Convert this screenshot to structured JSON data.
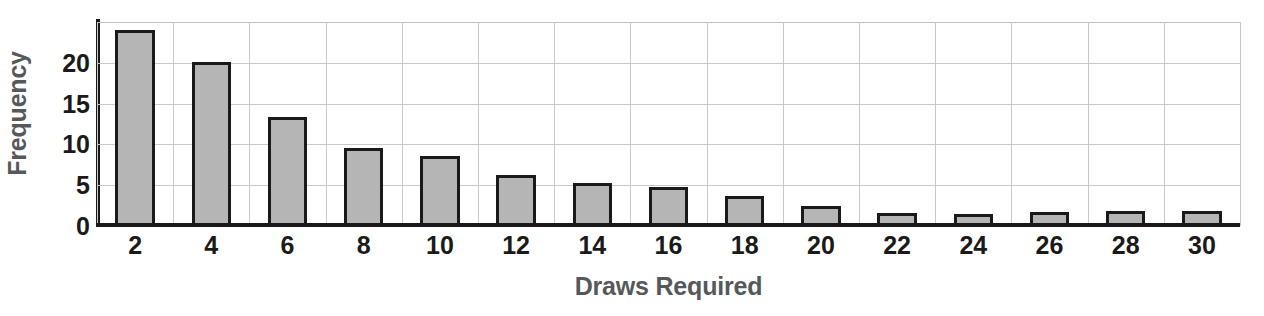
{
  "chart_data": {
    "type": "bar",
    "title": "",
    "subtitle": "",
    "xlabel": "Draws Required",
    "ylabel": "Frequency",
    "categories": [
      "2",
      "4",
      "6",
      "8",
      "10",
      "12",
      "14",
      "16",
      "18",
      "20",
      "22",
      "24",
      "26",
      "28",
      "30"
    ],
    "values": [
      24.0,
      20.1,
      13.4,
      9.6,
      8.6,
      6.2,
      5.3,
      4.8,
      3.7,
      2.4,
      1.6,
      1.5,
      1.7,
      1.8,
      1.8
    ],
    "series": [
      {
        "name": "Frequency",
        "values": [
          24.0,
          20.1,
          13.4,
          9.6,
          8.6,
          6.2,
          5.3,
          4.8,
          3.7,
          2.4,
          1.6,
          1.5,
          1.7,
          1.8,
          1.8
        ]
      }
    ],
    "xlim": [
      1,
      31
    ],
    "ylim": [
      0,
      25
    ],
    "yticks": [
      0,
      5,
      10,
      15,
      20
    ],
    "ytick_labels": [
      "0",
      "5",
      "10",
      "15",
      "20"
    ],
    "xtick_labels": [
      "2",
      "4",
      "6",
      "8",
      "10",
      "12",
      "14",
      "16",
      "18",
      "20",
      "22",
      "24",
      "26",
      "28",
      "30"
    ],
    "grid": true,
    "grid_axis": "both",
    "legend": false,
    "legend_position": "none",
    "bar_fill_color": "#b5b5b5",
    "bar_edge_color": "#1a1a1a",
    "grid_color": "#c9c9c9",
    "axis_color": "#1a1a1a",
    "axis_label_color": "#55595b",
    "tick_label_color": "#1a1a1a",
    "background_color": "#ffffff"
  }
}
